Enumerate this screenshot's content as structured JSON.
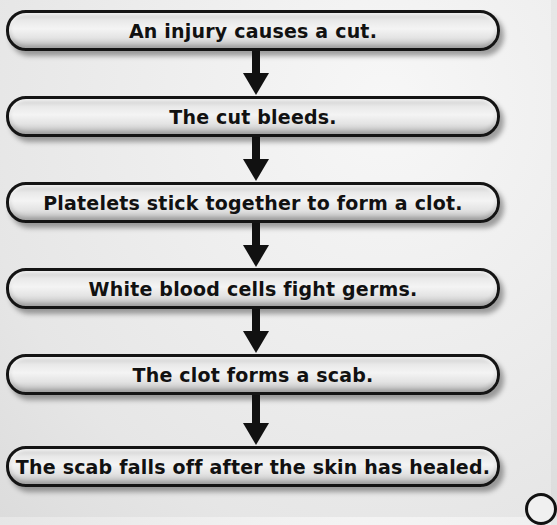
{
  "diagram": {
    "type": "flowchart",
    "direction": "top-to-bottom",
    "steps": [
      {
        "label": "An injury causes a cut."
      },
      {
        "label": "The cut bleeds."
      },
      {
        "label": "Platelets stick together to form a clot."
      },
      {
        "label": "White blood cells fight germs."
      },
      {
        "label": "The clot forms a scab."
      },
      {
        "label": "The scab falls off after the skin has healed."
      }
    ],
    "connectors": [
      {
        "from": 0,
        "to": 1,
        "icon": "arrow-down-icon"
      },
      {
        "from": 1,
        "to": 2,
        "icon": "arrow-down-icon"
      },
      {
        "from": 2,
        "to": 3,
        "icon": "arrow-down-icon"
      },
      {
        "from": 3,
        "to": 4,
        "icon": "arrow-down-icon"
      },
      {
        "from": 4,
        "to": 5,
        "icon": "arrow-down-icon"
      }
    ],
    "colors": {
      "box_border": "#141414",
      "box_fill": "#e9e9e9",
      "arrow": "#111111",
      "text": "#111111",
      "background": "#eeeeee"
    }
  }
}
